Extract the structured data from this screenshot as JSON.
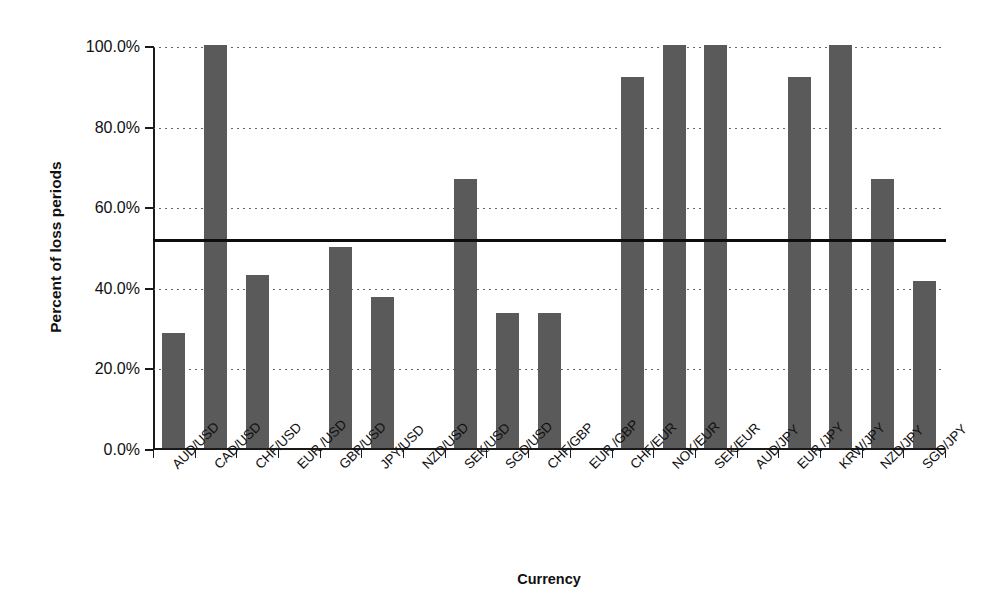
{
  "chart_data": {
    "type": "bar",
    "title": "",
    "subtitle": "",
    "xlabel": "Currency",
    "ylabel": "Percent of loss periods",
    "ylim": [
      0,
      100
    ],
    "ytick_labels": [
      "0.0%",
      "20.0%",
      "40.0%",
      "60.0%",
      "80.0%",
      "100.0%"
    ],
    "ytick_values": [
      0,
      20,
      40,
      60,
      80,
      100
    ],
    "grid": "horizontal-dotted",
    "legend": "none",
    "bar_color": "#5a5a5a",
    "categories": [
      "AUD/USD",
      "CAD/USD",
      "CHF/USD",
      "EUR /USD",
      "GBP/USD",
      "JPY/USD",
      "NZD/USD",
      "SEK/USD",
      "SGD/USD",
      "CHF/GBP",
      "EUR /GBP",
      "CHF/EUR",
      "NOK/EUR",
      "SEK/EUR",
      "AUD/JPY",
      "EUR /JPY",
      "KRW/JPY",
      "NZD/JPY",
      "SGD/JPY"
    ],
    "values": [
      28.5,
      100.0,
      43.0,
      0.0,
      50.0,
      37.5,
      0.0,
      66.7,
      33.5,
      33.5,
      0.0,
      92.0,
      100.0,
      100.0,
      0.0,
      92.0,
      100.0,
      66.7,
      41.5
    ],
    "annotations": [
      {
        "name": "reference-line",
        "type": "horizontal-line",
        "value": 52.0,
        "color": "#0d0d0d"
      }
    ]
  }
}
